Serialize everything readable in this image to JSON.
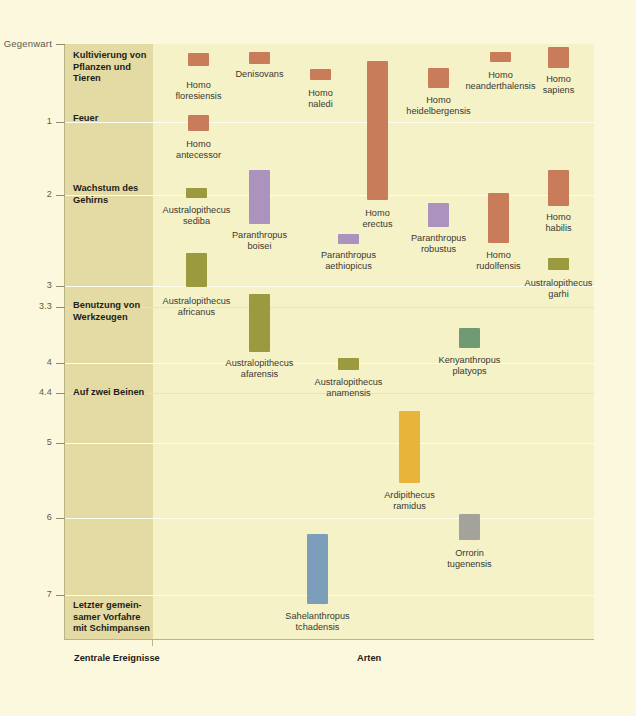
{
  "axis": {
    "y_title": "Millionen Jahre her",
    "present_label": "Gegenwart",
    "ticks": [
      {
        "label": "Gegenwart",
        "value": 0,
        "y": 44
      },
      {
        "label": "1",
        "value": 1,
        "y": 122
      },
      {
        "label": "2",
        "value": 2,
        "y": 195
      },
      {
        "label": "3",
        "value": 3,
        "y": 286
      },
      {
        "label": "3.3",
        "value": 3.3,
        "y": 307
      },
      {
        "label": "4",
        "value": 4,
        "y": 363
      },
      {
        "label": "4.4",
        "value": 4.4,
        "y": 393
      },
      {
        "label": "5",
        "value": 5,
        "y": 443
      },
      {
        "label": "6",
        "value": 6,
        "y": 518
      },
      {
        "label": "7",
        "value": 7,
        "y": 595
      }
    ]
  },
  "captions": {
    "events_column": "Zentrale Ereignisse",
    "species_column": "Arten"
  },
  "events": [
    {
      "name": "cultivation",
      "label": "Kultivierung von\nPflanzen und\nTieren",
      "y": 50
    },
    {
      "name": "fire",
      "label": "Feuer",
      "y": 113
    },
    {
      "name": "brain-growth",
      "label": "Wachstum des\nGehirns",
      "y": 183
    },
    {
      "name": "tool-use",
      "label": "Benutzung von\nWerkzeugen",
      "y": 300
    },
    {
      "name": "bipedalism",
      "label": "Auf zwei Beinen",
      "y": 387
    },
    {
      "name": "last-common-ancestor",
      "label": "Letzter gemein-\nsamer Vorfahre\nmit Schimpansen",
      "y": 600
    }
  ],
  "colors": {
    "background": "#fbf8dd",
    "plot_background": "#f6f2c8",
    "events_band": "#e3dba3",
    "homo": "#c87c5a",
    "australopithecus": "#9b9a3e",
    "paranthropus": "#ac93bd",
    "kenyanthropus": "#6f9a73",
    "ardipithecus": "#e8b53a",
    "orrorin": "#a3a39b",
    "sahelanthropus": "#7d9ebb",
    "gridline": "#fdfdf0"
  },
  "chart_data": {
    "type": "bar",
    "xlabel": "Arten",
    "ylabel": "Millionen Jahre her",
    "ylim": [
      0,
      7.6
    ],
    "y_inverted": true,
    "grid": true,
    "legend": "none",
    "species": [
      {
        "name": "Homo floresiensis",
        "label": "Homo\nfloresiensis",
        "group": "homo",
        "color": "#c87c5a",
        "x": 188,
        "w": 21,
        "y0": 53,
        "y1": 66,
        "from": 0.1,
        "to": 0.05,
        "label_x": 160,
        "label_y": 80
      },
      {
        "name": "Denisovans",
        "label": "Denisovans",
        "group": "homo",
        "color": "#c87c5a",
        "x": 249,
        "w": 21,
        "y0": 52,
        "y1": 64,
        "from": 0.08,
        "to": 0.03,
        "label_x": 224,
        "label_y": 69
      },
      {
        "name": "Homo naledi",
        "label": "Homo\nnaledi",
        "group": "homo",
        "color": "#c87c5a",
        "x": 310,
        "w": 21,
        "y0": 69,
        "y1": 80,
        "from": 0.34,
        "to": 0.24,
        "label_x": 287,
        "label_y": 88
      },
      {
        "name": "Homo erectus",
        "label": "Homo\nerectus",
        "group": "homo",
        "color": "#c87c5a",
        "x": 367,
        "w": 21,
        "y0": 61,
        "y1": 200,
        "from": 1.9,
        "to": 0.11,
        "label_x": 341,
        "label_y": 208
      },
      {
        "name": "Homo heidelbergensis",
        "label": "Homo\nheidelbergensis",
        "group": "homo",
        "color": "#c87c5a",
        "x": 428,
        "w": 21,
        "y0": 68,
        "y1": 88,
        "from": 0.6,
        "to": 0.2,
        "label_x": 396,
        "label_y": 95
      },
      {
        "name": "Homo neanderthalensis",
        "label": "Homo\nneanderthalensis",
        "group": "homo",
        "color": "#c87c5a",
        "x": 490,
        "w": 21,
        "y0": 52,
        "y1": 62,
        "from": 0.25,
        "to": 0.03,
        "label_x": 452,
        "label_y": 70
      },
      {
        "name": "Homo sapiens",
        "label": "Homo\nsapiens",
        "group": "homo",
        "color": "#c87c5a",
        "x": 548,
        "w": 21,
        "y0": 47,
        "y1": 68,
        "from": 0.33,
        "to": 0.0,
        "label_x": 527,
        "label_y": 74
      },
      {
        "name": "Homo antecessor",
        "label": "Homo\nantecessor",
        "group": "homo",
        "color": "#c87c5a",
        "x": 188,
        "w": 21,
        "y0": 115,
        "y1": 131,
        "from": 1.2,
        "to": 0.8,
        "label_x": 163,
        "label_y": 139
      },
      {
        "name": "Australopithecus sediba",
        "label": "Australopithecus\nsediba",
        "group": "australopithecus",
        "color": "#9b9a3e",
        "x": 186,
        "w": 21,
        "y0": 188,
        "y1": 198,
        "from": 2.0,
        "to": 1.78,
        "label_x": 147,
        "label_y": 205
      },
      {
        "name": "Paranthropus boisei",
        "label": "Paranthropus\nboisei",
        "group": "paranthropus",
        "color": "#ac93bd",
        "x": 249,
        "w": 21,
        "y0": 170,
        "y1": 224,
        "from": 2.3,
        "to": 1.2,
        "label_x": 218,
        "label_y": 230
      },
      {
        "name": "Paranthropus aethiopicus",
        "label": "Paranthropus\naethiopicus",
        "group": "paranthropus",
        "color": "#ac93bd",
        "x": 338,
        "w": 21,
        "y0": 234,
        "y1": 244,
        "from": 2.7,
        "to": 2.4,
        "label_x": 305,
        "label_y": 250
      },
      {
        "name": "Paranthropus robustus",
        "label": "Paranthropus\nrobustus",
        "group": "paranthropus",
        "color": "#ac93bd",
        "x": 428,
        "w": 21,
        "y0": 203,
        "y1": 227,
        "from": 2.0,
        "to": 1.4,
        "label_x": 398,
        "label_y": 233
      },
      {
        "name": "Homo rudolfensis",
        "label": "Homo\nrudolfensis",
        "group": "homo",
        "color": "#c87c5a",
        "x": 488,
        "w": 21,
        "y0": 193,
        "y1": 243,
        "from": 2.4,
        "to": 1.7,
        "label_x": 463,
        "label_y": 250
      },
      {
        "name": "Homo habilis",
        "label": "Homo\nhabilis",
        "group": "homo",
        "color": "#c87c5a",
        "x": 548,
        "w": 21,
        "y0": 170,
        "y1": 206,
        "from": 2.3,
        "to": 1.65,
        "label_x": 527,
        "label_y": 212
      },
      {
        "name": "Australopithecus africanus",
        "label": "Australopithecus\nafricanus",
        "group": "australopithecus",
        "color": "#9b9a3e",
        "x": 186,
        "w": 21,
        "y0": 253,
        "y1": 287,
        "from": 3.3,
        "to": 2.5,
        "label_x": 147,
        "label_y": 296
      },
      {
        "name": "Australopithecus garhi",
        "label": "Australopithecus\ngarhi",
        "group": "australopithecus",
        "color": "#9b9a3e",
        "x": 548,
        "w": 21,
        "y0": 258,
        "y1": 270,
        "from": 2.7,
        "to": 2.4,
        "label_x": 513,
        "label_y": 278
      },
      {
        "name": "Australopithecus afarensis",
        "label": "Australopithecus\nafarensis",
        "group": "australopithecus",
        "color": "#9b9a3e",
        "x": 249,
        "w": 21,
        "y0": 294,
        "y1": 352,
        "from": 3.9,
        "to": 2.9,
        "label_x": 210,
        "label_y": 358
      },
      {
        "name": "Kenyanthropus platyops",
        "label": "Kenyanthropus\nplatyops",
        "group": "kenyanthropus",
        "color": "#6f9a73",
        "x": 459,
        "w": 21,
        "y0": 328,
        "y1": 348,
        "from": 3.5,
        "to": 3.2,
        "label_x": 428,
        "label_y": 355
      },
      {
        "name": "Australopithecus anamensis",
        "label": "Australopithecus\nanamensis",
        "group": "australopithecus",
        "color": "#9b9a3e",
        "x": 338,
        "w": 21,
        "y0": 358,
        "y1": 370,
        "from": 4.2,
        "to": 3.9,
        "label_x": 299,
        "label_y": 377
      },
      {
        "name": "Ardipithecus ramidus",
        "label": "Ardipithecus\nramidus",
        "group": "ardipithecus",
        "color": "#e8b53a",
        "x": 399,
        "w": 21,
        "y0": 411,
        "y1": 483,
        "from": 5.8,
        "to": 4.4,
        "label_x": 372,
        "label_y": 490
      },
      {
        "name": "Orrorin tugenensis",
        "label": "Orrorin\ntugenensis",
        "group": "orrorin",
        "color": "#a3a39b",
        "x": 459,
        "w": 21,
        "y0": 514,
        "y1": 540,
        "from": 6.2,
        "to": 5.7,
        "label_x": 435,
        "label_y": 548
      },
      {
        "name": "Sahelanthropus tchadensis",
        "label": "Sahelanthropus\ntchadensis",
        "group": "sahelanthropus",
        "color": "#7d9ebb",
        "x": 307,
        "w": 21,
        "y0": 534,
        "y1": 604,
        "from": 7.2,
        "to": 6.1,
        "label_x": 273,
        "label_y": 611
      }
    ]
  }
}
